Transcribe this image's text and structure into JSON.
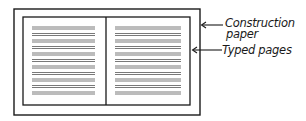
{
  "diagram": {
    "colors": {
      "stroke": "#1a1a1a",
      "text_lines": "#555555",
      "background": "#ffffff"
    },
    "construction_paper": {
      "label_line1": "Construction",
      "label_line2": "paper",
      "rect": {
        "x": 14,
        "y": 9,
        "width": 186,
        "height": 106
      }
    },
    "typed_pages": {
      "label": "Typed pages",
      "rect": {
        "x": 23,
        "y": 17,
        "width": 167,
        "height": 88
      },
      "divider_x": 106,
      "page_count": 2,
      "left_text_block": {
        "x1": 32,
        "x2": 95
      },
      "right_text_block": {
        "x1": 115,
        "x2": 181
      },
      "line_rows": 11
    },
    "arrows": [
      {
        "name": "construction-paper-arrow",
        "from": [
          222,
          25
        ],
        "to": [
          201,
          25
        ]
      },
      {
        "name": "typed-pages-arrow",
        "from": [
          222,
          50
        ],
        "to": [
          192,
          50
        ]
      }
    ]
  }
}
